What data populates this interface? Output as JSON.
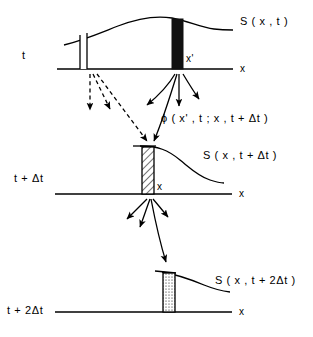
{
  "figure": {
    "background": "#ffffff",
    "ink": "#000000",
    "width": 313,
    "height": 337
  },
  "panels": [
    {
      "id": "panel-t",
      "time_label": "t",
      "axis_label": "x",
      "curve_label": "S ( x , t )",
      "point_label": "x'",
      "bar_style": "open",
      "bar_style_2": "filled"
    },
    {
      "id": "panel-t-plus-dt",
      "time_label": "t + Δt",
      "axis_label": "x",
      "curve_label": "S ( x , t + Δt )",
      "point_label": "x",
      "bar_style": "hatched"
    },
    {
      "id": "panel-t-plus-2dt",
      "time_label": "t + 2Δt",
      "axis_label": "x",
      "curve_label": "S ( x , t + 2Δt )",
      "bar_style": "dotted"
    }
  ],
  "propagator": {
    "label": "ϕ ( x' , t ; x , t + Δt )"
  },
  "arrows": {
    "dashed_group_label": "dashed-transport-arrows",
    "solid_group_label": "solid-transport-arrows",
    "dashed_count": 3,
    "solid_count_top": 4,
    "solid_count_mid": 4
  },
  "colors": {
    "ink": "#000000",
    "fill_solid": "#111111",
    "fill_open": "#ffffff"
  }
}
